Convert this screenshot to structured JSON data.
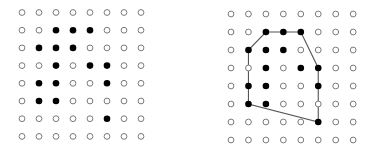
{
  "figure": {
    "colors": {
      "filled": "#000000",
      "empty_stroke": "#7a7a7a",
      "hull": "#555555",
      "background": "#ffffff"
    },
    "grid": {
      "rows": 8,
      "cols": 8
    },
    "filled_points": [
      [
        2,
        1
      ],
      [
        3,
        1
      ],
      [
        4,
        1
      ],
      [
        1,
        2
      ],
      [
        2,
        2
      ],
      [
        3,
        2
      ],
      [
        2,
        3
      ],
      [
        4,
        3
      ],
      [
        5,
        3
      ],
      [
        1,
        4
      ],
      [
        2,
        4
      ],
      [
        5,
        4
      ],
      [
        1,
        5
      ],
      [
        2,
        5
      ],
      [
        5,
        6
      ]
    ],
    "panels": [
      {
        "name": "point-set",
        "show_hull": false
      },
      {
        "name": "convex-hull",
        "show_hull": true
      }
    ],
    "hull_vertices": [
      [
        2,
        1
      ],
      [
        4,
        1
      ],
      [
        5,
        3
      ],
      [
        5,
        6
      ],
      [
        1,
        5
      ],
      [
        1,
        2
      ]
    ]
  }
}
